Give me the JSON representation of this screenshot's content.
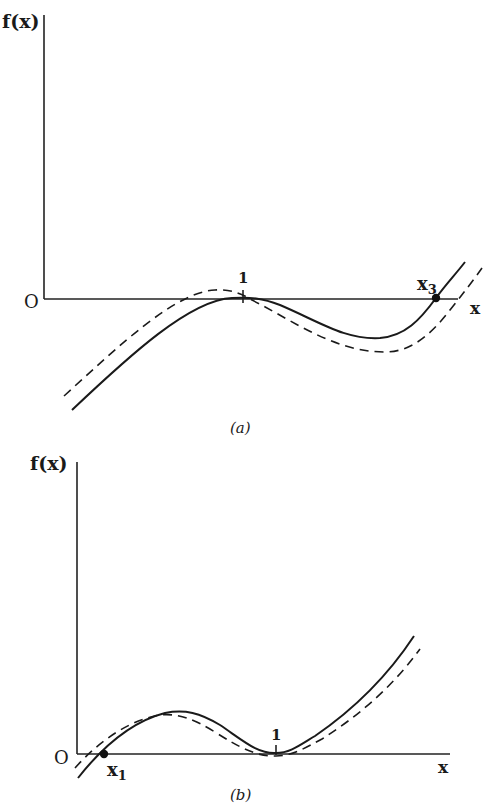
{
  "panels": [
    {
      "id": "a",
      "caption": "(a)",
      "y_axis_label": "f(x)",
      "x_axis_label": "x",
      "origin_label": "O",
      "tick_label": "1",
      "root_label_main": "x",
      "root_label_sub": "3",
      "curves": [
        "solid: f(x) tangent to x-axis at x=1, dips below, crosses at x3",
        "dashed: shifted-down curve"
      ]
    },
    {
      "id": "b",
      "caption": "(b)",
      "y_axis_label": "f(x)",
      "x_axis_label": "x",
      "origin_label": "O",
      "tick_label": "1",
      "root_label_main": "x",
      "root_label_sub": "1",
      "curves": [
        "solid: f(x) crosses at x1, local max, tangent at x=1, rises",
        "dashed: shifted curve"
      ]
    }
  ]
}
